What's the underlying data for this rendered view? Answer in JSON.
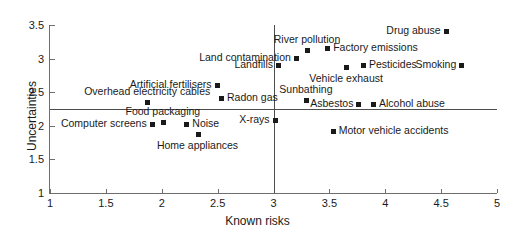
{
  "chart_data": {
    "type": "scatter",
    "title": "",
    "xlabel": "Known risks",
    "ylabel": "Uncertainties",
    "xlim": [
      1,
      5
    ],
    "ylim": [
      1,
      3.5
    ],
    "xticks": [
      "1",
      "1.5",
      "2",
      "2.5",
      "3",
      "3.5",
      "4",
      "4.5",
      "5"
    ],
    "xtick_values": [
      1,
      1.5,
      2,
      2.5,
      3,
      3.5,
      4,
      4.5,
      5
    ],
    "yticks": [
      "1",
      "1.5",
      "2",
      "2.5",
      "3",
      "3.5"
    ],
    "ytick_values": [
      1,
      1.5,
      2,
      2.5,
      3,
      3.5
    ],
    "grid": false,
    "legend": "none",
    "reference_lines": [
      {
        "orientation": "horizontal",
        "value": 2.25
      },
      {
        "orientation": "vertical",
        "value": 3.0
      }
    ],
    "marker_color": "#1a1a1a",
    "axis_color": "#6e6e6e",
    "points": [
      {
        "label": "Drug abuse",
        "x": 4.54,
        "y": 3.41,
        "label_pos": "left"
      },
      {
        "label": "Factory emissions",
        "x": 3.48,
        "y": 3.16,
        "label_pos": "right"
      },
      {
        "label": "River pollution",
        "x": 3.3,
        "y": 3.13,
        "label_pos": "above"
      },
      {
        "label": "Land contamination",
        "x": 3.2,
        "y": 3.01,
        "label_pos": "left"
      },
      {
        "label": "Landfills",
        "x": 3.04,
        "y": 2.9,
        "label_pos": "left"
      },
      {
        "label": "Smoking",
        "x": 4.68,
        "y": 2.9,
        "label_pos": "left"
      },
      {
        "label": "Pesticides",
        "x": 3.8,
        "y": 2.9,
        "label_pos": "right"
      },
      {
        "label": "Vehicle exhaust",
        "x": 3.65,
        "y": 2.87,
        "label_pos": "below"
      },
      {
        "label": "Artificial fertilisers",
        "x": 2.49,
        "y": 2.6,
        "label_pos": "left"
      },
      {
        "label": "Radon gas",
        "x": 2.53,
        "y": 2.41,
        "label_pos": "right"
      },
      {
        "label": "Sunbathing",
        "x": 3.29,
        "y": 2.38,
        "label_pos": "above"
      },
      {
        "label": "Overhead electricity cables",
        "x": 1.87,
        "y": 2.36,
        "label_pos": "above"
      },
      {
        "label": "Alcohol abuse",
        "x": 3.89,
        "y": 2.32,
        "label_pos": "right"
      },
      {
        "label": "Asbestos",
        "x": 3.76,
        "y": 2.32,
        "label_pos": "left"
      },
      {
        "label": "X-rays",
        "x": 3.01,
        "y": 2.09,
        "label_pos": "left"
      },
      {
        "label": "Noise",
        "x": 2.22,
        "y": 2.03,
        "label_pos": "right"
      },
      {
        "label": "Food packaging",
        "x": 2.01,
        "y": 2.05,
        "label_pos": "above"
      },
      {
        "label": "Computer screens",
        "x": 1.91,
        "y": 2.02,
        "label_pos": "left"
      },
      {
        "label": "Motor vehicle accidents",
        "x": 3.53,
        "y": 1.93,
        "label_pos": "right"
      },
      {
        "label": "Home appliances",
        "x": 2.32,
        "y": 1.88,
        "label_pos": "below"
      }
    ]
  }
}
